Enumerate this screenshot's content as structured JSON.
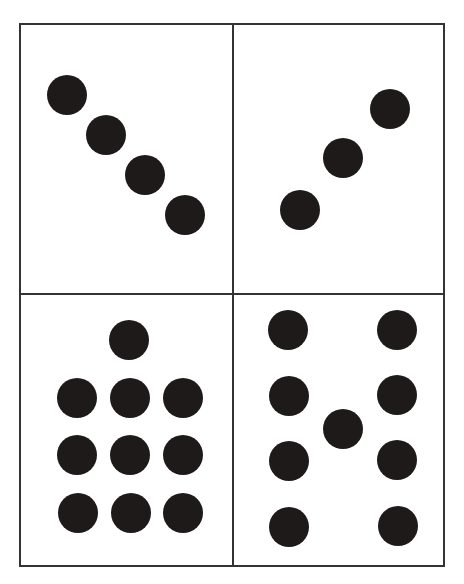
{
  "figure": {
    "border_color": "#333333",
    "dot_color": "#1e1a1a",
    "dot_radius": 20,
    "outer_box": {
      "x": 20,
      "y": 24,
      "w": 424,
      "h": 542
    },
    "divider_x": 233,
    "divider_y": 294,
    "panels": [
      {
        "id": "top-left",
        "count": 4,
        "dots": [
          [
            67,
            95
          ],
          [
            106,
            135
          ],
          [
            145,
            175
          ],
          [
            185,
            215
          ]
        ]
      },
      {
        "id": "top-right",
        "count": 3,
        "dots": [
          [
            300,
            210
          ],
          [
            343,
            158
          ],
          [
            390,
            109
          ]
        ]
      },
      {
        "id": "bottom-left",
        "count": 10,
        "dots": [
          [
            129,
            340
          ],
          [
            77,
            398
          ],
          [
            130,
            398
          ],
          [
            183,
            398
          ],
          [
            77,
            455
          ],
          [
            130,
            455
          ],
          [
            183,
            455
          ],
          [
            78,
            513
          ],
          [
            131,
            513
          ],
          [
            183,
            513
          ]
        ]
      },
      {
        "id": "bottom-right",
        "count": 9,
        "dots": [
          [
            288,
            330
          ],
          [
            289,
            396
          ],
          [
            289,
            461
          ],
          [
            289,
            527
          ],
          [
            397,
            330
          ],
          [
            397,
            395
          ],
          [
            397,
            460
          ],
          [
            398,
            526
          ],
          [
            343,
            429
          ]
        ]
      }
    ]
  }
}
